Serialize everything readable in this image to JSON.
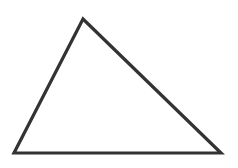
{
  "diagram": {
    "shape": "triangle",
    "type": "scalene-triangle-outline",
    "vertices": [
      {
        "name": "apex",
        "x": 83,
        "y": 19
      },
      {
        "name": "bottom-left",
        "x": 14,
        "y": 153
      },
      {
        "name": "bottom-right",
        "x": 221,
        "y": 153
      }
    ],
    "stroke_color": "#333333",
    "stroke_width": 3.2,
    "fill_color": "#ffffff",
    "background_color": "#ffffff"
  }
}
